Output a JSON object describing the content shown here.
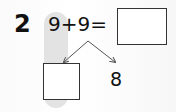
{
  "question": {
    "number": "2",
    "expression": "9+9=",
    "answer_box": "",
    "decomposition": {
      "unknown_box": "",
      "known_part": "8"
    }
  },
  "colors": {
    "text": "#111111",
    "highlight": "#d9d9d9",
    "box_border": "#333333"
  }
}
